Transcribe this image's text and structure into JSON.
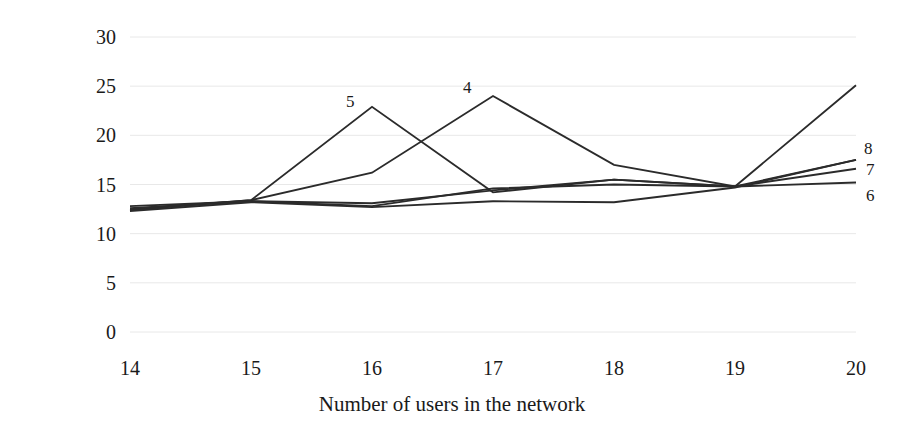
{
  "chart_data": {
    "type": "line",
    "title": "",
    "xlabel": "Number of users in the network",
    "ylabel": "Time to the first frame, s",
    "x": [
      14,
      15,
      16,
      17,
      18,
      19,
      20
    ],
    "categories": [
      "14",
      "15",
      "16",
      "17",
      "18",
      "19",
      "20"
    ],
    "xticklabels": [
      "14",
      "15",
      "16",
      "17",
      "18",
      "19",
      "20"
    ],
    "yticklabels": [
      "0",
      "5",
      "10",
      "15",
      "20",
      "25",
      "30"
    ],
    "yticks": [
      0,
      5,
      10,
      15,
      20,
      25,
      30
    ],
    "ylim": [
      0,
      30
    ],
    "xlim": [
      14,
      20
    ],
    "grid": "horizontal",
    "legend": "inline-end-labels",
    "series": [
      {
        "name": "4",
        "label": "4",
        "values": [
          12.5,
          13.4,
          16.2,
          24.0,
          17.0,
          14.8,
          25.1
        ]
      },
      {
        "name": "5",
        "label": "5",
        "values": [
          12.4,
          13.4,
          22.9,
          14.2,
          15.5,
          14.8,
          17.5
        ]
      },
      {
        "name": "6",
        "label": "6",
        "values": [
          12.8,
          13.3,
          13.1,
          14.4,
          15.5,
          14.8,
          15.2
        ]
      },
      {
        "name": "7",
        "label": "7",
        "values": [
          12.6,
          13.3,
          12.8,
          14.6,
          15.0,
          14.8,
          16.6
        ]
      },
      {
        "name": "8",
        "label": "8",
        "values": [
          12.3,
          13.2,
          12.7,
          13.3,
          13.2,
          14.7,
          17.5
        ]
      }
    ],
    "inline_labels": [
      {
        "text": "5",
        "x": 16,
        "y": 22.9
      },
      {
        "text": "4",
        "x": 17,
        "y": 24.0
      },
      {
        "text": "8",
        "x": 20,
        "y": 17.5
      },
      {
        "text": "7",
        "x": 20,
        "y": 16.6
      },
      {
        "text": "6",
        "x": 20,
        "y": 15.2
      }
    ],
    "colors": {
      "line": "#2b2b2b",
      "grid": "#e8e8e8",
      "background": "#ffffff",
      "text": "#1a1a1a"
    }
  }
}
